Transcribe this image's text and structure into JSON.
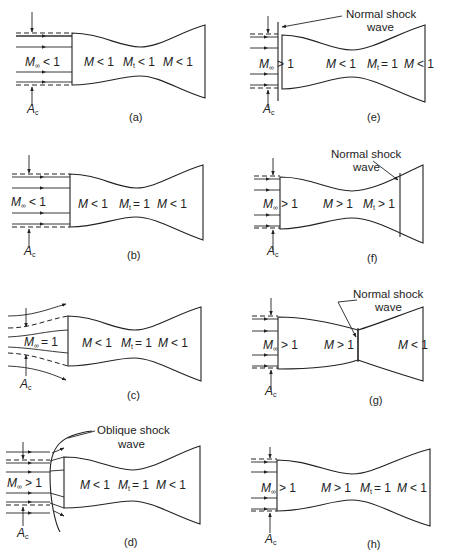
{
  "figure": {
    "panels": [
      {
        "id": "a",
        "caption": "(a)",
        "freestream": "M∞ < 1",
        "regions": [
          "M < 1",
          "Mt < 1",
          "M < 1"
        ],
        "capture_label": "Ac",
        "annotation": ""
      },
      {
        "id": "b",
        "caption": "(b)",
        "freestream": "M∞ < 1",
        "regions": [
          "M < 1",
          "Mt = 1",
          "M < 1"
        ],
        "capture_label": "Ac",
        "annotation": ""
      },
      {
        "id": "c",
        "caption": "(c)",
        "freestream": "M∞ = 1",
        "regions": [
          "M < 1",
          "Mt = 1",
          "M < 1"
        ],
        "capture_label": "Ac",
        "annotation": ""
      },
      {
        "id": "d",
        "caption": "(d)",
        "freestream": "M∞ > 1",
        "regions": [
          "M < 1",
          "Mt = 1",
          "M < 1"
        ],
        "capture_label": "Ac",
        "annotation": "Oblique shock\nwave"
      },
      {
        "id": "e",
        "caption": "(e)",
        "freestream": "M∞ > 1",
        "regions": [
          "M < 1",
          "Mt = 1",
          "M < 1"
        ],
        "capture_label": "Ac",
        "annotation": "Normal shock\nwave"
      },
      {
        "id": "f",
        "caption": "(f)",
        "freestream": "M∞ > 1",
        "regions": [
          "M > 1",
          "Mt > 1"
        ],
        "capture_label": "Ac",
        "annotation": "Normal shock\nwave"
      },
      {
        "id": "g",
        "caption": "(g)",
        "freestream": "M∞ > 1",
        "regions": [
          "M > 1",
          "M < 1"
        ],
        "capture_label": "Ac",
        "annotation": "Normal shock\nwave"
      },
      {
        "id": "h",
        "caption": "(h)",
        "freestream": "M∞ > 1",
        "regions": [
          "M > 1",
          "Mt = 1",
          "M < 1"
        ],
        "capture_label": "Ac",
        "annotation": ""
      }
    ],
    "text": {
      "a_free": "< 1",
      "a_r1": "< 1",
      "a_r2": "< 1",
      "a_r3": "< 1",
      "a_cap": "(a)",
      "b_free": "< 1",
      "b_r1": "< 1",
      "b_r2": "= 1",
      "b_r3": "< 1",
      "b_cap": "(b)",
      "c_free": "= 1",
      "c_r1": "< 1",
      "c_r2": "= 1",
      "c_r3": "< 1",
      "c_cap": "(c)",
      "d_free": "> 1",
      "d_r1": "< 1",
      "d_r2": "= 1",
      "d_r3": "< 1",
      "d_cap": "(d)",
      "d_ann1": "Oblique shock",
      "d_ann2": "wave",
      "e_free": "> 1",
      "e_r1": "< 1",
      "e_r2": "= 1",
      "e_r3": "< 1",
      "e_cap": "(e)",
      "e_ann1": "Normal shock",
      "e_ann2": "wave",
      "f_free": "> 1",
      "f_r1": "> 1",
      "f_r2": "> 1",
      "f_cap": "(f)",
      "f_ann1": "Normal shock",
      "f_ann2": "wave",
      "g_free": "> 1",
      "g_r1": "> 1",
      "g_r2": "< 1",
      "g_cap": "(g)",
      "g_ann1": "Normal shock",
      "g_ann2": "wave",
      "h_free": "> 1",
      "h_r1": "> 1",
      "h_r2": "= 1",
      "h_r3": "< 1",
      "h_cap": "(h)",
      "M": "M",
      "Minf_sub": "∞",
      "Mt_sub": "t",
      "A": "A",
      "A_sub": "c"
    }
  }
}
